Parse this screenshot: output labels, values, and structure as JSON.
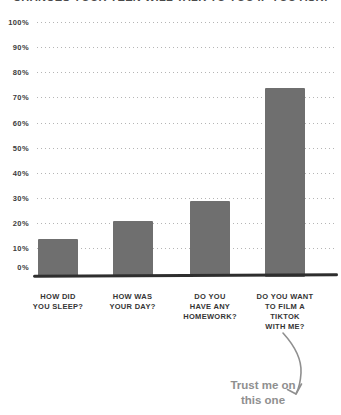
{
  "page": {
    "background": "#ffffff"
  },
  "title": {
    "text": "CHANCES YOUR TEEN WILL TALK TO YOU IF YOU ASK:"
  },
  "chart_data": {
    "type": "bar",
    "title": "CHANCES YOUR TEEN WILL TALK TO YOU IF YOU ASK:",
    "categories": [
      [
        "HOW DID",
        "YOU SLEEP?"
      ],
      [
        "HOW WAS",
        "YOUR DAY?"
      ],
      [
        "DO YOU",
        "HAVE ANY",
        "HOMEWORK?"
      ],
      [
        "DO YOU WANT",
        "TO FILM A",
        "TIKTOK",
        "WITH ME?"
      ]
    ],
    "values": [
      15,
      22,
      30,
      75
    ],
    "value_unit": "%",
    "y_ticks": [
      "0%",
      "10%",
      "20%",
      "30%",
      "40%",
      "50%",
      "60%",
      "70%",
      "80%",
      "90%",
      "100%"
    ],
    "ylim": [
      0,
      100
    ],
    "xlabel": "",
    "ylabel": "",
    "grid": "horizontal-dotted",
    "legend": "none",
    "annotation": {
      "lines": [
        "Trust me on",
        "this one"
      ],
      "points_to": "DO YOU WANT TO FILM A TIKTOK WITH ME?"
    }
  },
  "colors": {
    "bar": "#6f6f6f",
    "axis_labels": "#3c3c3c",
    "gridline": "#b5b5b5",
    "baseline": "#2e2e2e",
    "annotation": "#8f8f8f",
    "background": "#ffffff"
  }
}
